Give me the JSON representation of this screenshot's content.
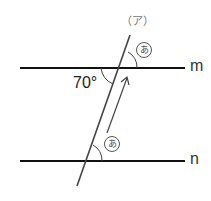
{
  "diagram": {
    "lines": {
      "top": {
        "label": "m"
      },
      "bottom": {
        "label": "n"
      },
      "transversal": {
        "label": "（ア）"
      }
    },
    "angles": {
      "known": "70°",
      "unknown_top": "あ",
      "unknown_bottom": "あ"
    }
  }
}
